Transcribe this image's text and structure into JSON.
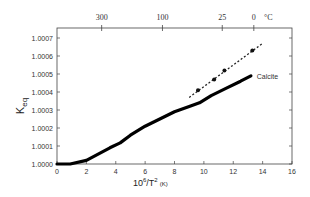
{
  "chart_data": {
    "type": "line",
    "title": "",
    "xlabel": "10^6/T^2 (K)",
    "xlabel_parts": {
      "base": "10",
      "exp": "6",
      "mid": "/T",
      "exp2": "2",
      "unit": "(K)"
    },
    "ylabel": "K_eq",
    "ylabel_parts": {
      "base": "K",
      "sub": "eq"
    },
    "xlim": [
      0,
      16
    ],
    "ylim": [
      1.0,
      1.00075
    ],
    "x_ticks": [
      0,
      2,
      4,
      6,
      8,
      10,
      12,
      14,
      16
    ],
    "x_tick_labels": [
      "0",
      "2",
      "4",
      "6",
      "8",
      "10",
      "12",
      "14",
      "16"
    ],
    "y_ticks": [
      1.0,
      1.0001,
      1.0002,
      1.0003,
      1.0004,
      1.0005,
      1.0006,
      1.0007
    ],
    "y_tick_labels": [
      "1.0000",
      "1.0001",
      "1.0002",
      "1.0003",
      "1.0004",
      "1.0005",
      "1.0006",
      "1.0007"
    ],
    "top_axis": {
      "label": "°C",
      "ticks": [
        {
          "label": "300",
          "x": 3.04
        },
        {
          "label": "100",
          "x": 7.18
        },
        {
          "label": "25",
          "x": 11.25
        },
        {
          "label": "0",
          "x": 13.4
        }
      ]
    },
    "grid": false,
    "series": [
      {
        "name": "Calcite",
        "style": "solid-thick",
        "x": [
          0.0,
          0.9,
          2.0,
          3.6,
          4.3,
          5.0,
          6.0,
          7.0,
          8.0,
          9.0,
          9.7,
          10.5,
          11.5,
          12.5,
          13.2
        ],
        "y": [
          1.0,
          1.0,
          1.00002,
          1.00009,
          1.000117,
          1.00016,
          1.00021,
          1.00025,
          1.00029,
          1.00032,
          1.00034,
          1.00038,
          1.00042,
          1.00046,
          1.00049
        ]
      },
      {
        "name": "measured",
        "style": "dashed-with-points",
        "line_x": [
          9.0,
          14.0
        ],
        "line_y": [
          1.00037,
          1.00067
        ],
        "x": [
          9.6,
          10.7,
          11.4,
          13.3
        ],
        "y": [
          1.00041,
          1.00047,
          1.00052,
          1.00063
        ]
      }
    ],
    "annotations": [
      {
        "text": "Calcite",
        "x": 13.6,
        "y": 1.00049
      }
    ]
  }
}
